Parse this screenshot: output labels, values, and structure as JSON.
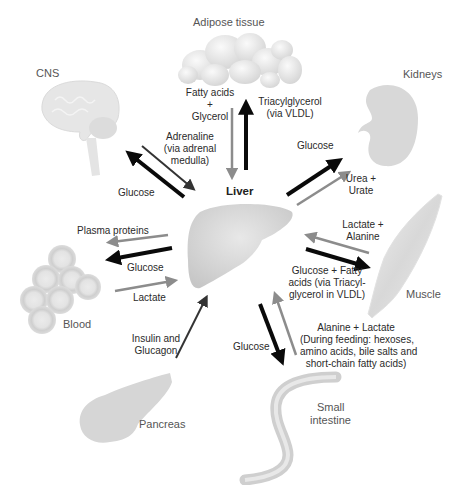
{
  "organs": {
    "adipose": "Adipose tissue",
    "cns": "CNS",
    "kidneys": "Kidneys",
    "liver": "Liver",
    "blood": "Blood",
    "muscle": "Muscle",
    "pancreas": "Pancreas",
    "small_intestine_1": "Small",
    "small_intestine_2": "intestine"
  },
  "flows": {
    "adipose_to_liver": [
      "Fatty acids",
      "+",
      "Glycerol"
    ],
    "liver_to_adipose": [
      "Triacylglycerol",
      "(via VLDL)"
    ],
    "cns_to_liver": [
      "Adrenaline",
      "(via adrenal",
      "medulla)"
    ],
    "liver_to_cns": "Glucose",
    "liver_to_kidneys": "Glucose",
    "kidneys_to_liver": [
      "Urea +",
      "Urate"
    ],
    "muscle_to_liver": [
      "Lactate +",
      "Alanine"
    ],
    "liver_to_muscle": [
      "Glucose + Fatty",
      "acids (via Triacyl-",
      "glycerol  in VLDL)"
    ],
    "liver_to_blood_proteins": "Plasma proteins",
    "liver_to_blood_glucose": "Glucose",
    "blood_to_liver": "Lactate",
    "pancreas_to_liver": [
      "Insulin and",
      "Glucagon"
    ],
    "liver_to_intestine": "Glucose",
    "intestine_to_liver": [
      "Alanine + Lactate",
      "(During feeding: hexoses,",
      "amino acids, bile salts and",
      "short-chain fatty acids)"
    ]
  },
  "colors": {
    "black_arrow": "#0a0a0a",
    "gray_arrow": "#8c8c8c",
    "dark_arrow": "#333333",
    "organ_fill": "#d9d9d9",
    "organ_light": "#ececec"
  }
}
